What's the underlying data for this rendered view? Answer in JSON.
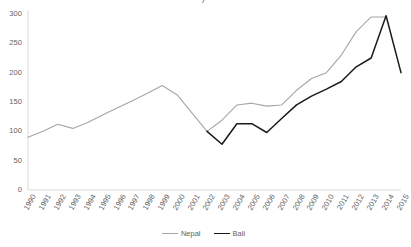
{
  "title_fragment": ")",
  "legend": {
    "position": "bottom-center",
    "entries": [
      {
        "label": "Nepal",
        "color": "#a6a6a6"
      },
      {
        "label": "Bali",
        "color": "#1a1a1a"
      }
    ]
  },
  "axis": {
    "y_ticks": [
      "0",
      "50",
      "100",
      "150",
      "200",
      "250",
      "300"
    ],
    "x_ticks": [
      "1990",
      "1991",
      "1992",
      "1993",
      "1994",
      "1995",
      "1996",
      "1997",
      "1998",
      "1999",
      "2000",
      "2001",
      "2002",
      "2003",
      "2004",
      "2005",
      "2006",
      "2007",
      "2008",
      "2009",
      "2010",
      "2011",
      "2012",
      "2013",
      "2014",
      "2015"
    ]
  },
  "chart_data": {
    "type": "line",
    "title": "",
    "xlabel": "",
    "ylabel": "",
    "grid": false,
    "legend_position": "bottom-center",
    "x": [
      1990,
      1991,
      1992,
      1993,
      1994,
      1995,
      1996,
      1997,
      1998,
      1999,
      2000,
      2001,
      2002,
      2003,
      2004,
      2005,
      2006,
      2007,
      2008,
      2009,
      2010,
      2011,
      2012,
      2013,
      2014,
      2015
    ],
    "xlim": [
      1990,
      2015
    ],
    "ylim": [
      0,
      300
    ],
    "series": [
      {
        "name": "Nepal",
        "color": "#a6a6a6",
        "values": [
          90,
          100,
          112,
          105,
          115,
          128,
          140,
          152,
          165,
          178,
          162,
          131,
          100,
          119,
          145,
          148,
          143,
          145,
          170,
          190,
          200,
          230,
          270,
          295,
          295,
          null
        ]
      },
      {
        "name": "Bali",
        "color": "#1a1a1a",
        "values": [
          null,
          null,
          null,
          null,
          null,
          null,
          null,
          null,
          null,
          null,
          null,
          null,
          100,
          78,
          113,
          113,
          98,
          122,
          145,
          160,
          172,
          185,
          210,
          225,
          297,
          200
        ]
      }
    ]
  },
  "geometry": {
    "plot_left": 28,
    "plot_right": 401,
    "plot_top": 14,
    "plot_bottom": 190
  }
}
